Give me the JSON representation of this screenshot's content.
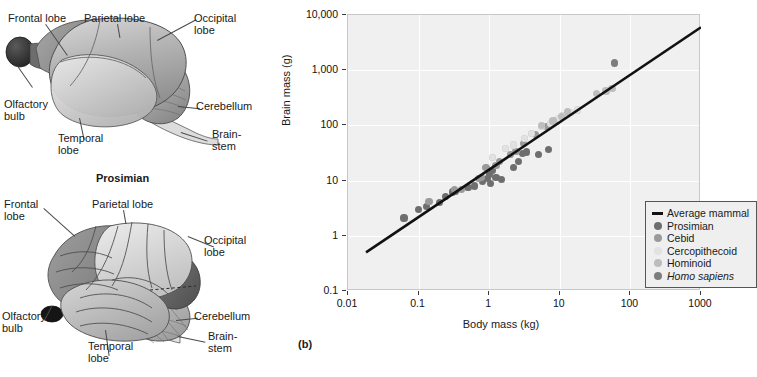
{
  "figure": {
    "panel_tag": "(b)"
  },
  "diagrams": [
    {
      "name": "prosimian-brain",
      "caption": "Prosimian",
      "labels": [
        {
          "key": "frontal",
          "text": "Frontal lobe"
        },
        {
          "key": "parietal",
          "text": "Parietal lobe"
        },
        {
          "key": "occipital",
          "text": "Occipital\nlobe"
        },
        {
          "key": "olfactory",
          "text": "Olfactory\nbulb"
        },
        {
          "key": "temporal",
          "text": "Temporal\nlobe"
        },
        {
          "key": "cerebellum",
          "text": "Cerebellum"
        },
        {
          "key": "brainstem",
          "text": "Brain-\nstem"
        }
      ]
    },
    {
      "name": "anthropoid-brain",
      "caption": "",
      "labels": [
        {
          "key": "frontal",
          "text": "Frontal\nlobe"
        },
        {
          "key": "parietal",
          "text": "Parietal lobe"
        },
        {
          "key": "occipital",
          "text": "Occipital\nlobe"
        },
        {
          "key": "olfactory",
          "text": "Olfactory\nbulb"
        },
        {
          "key": "temporal",
          "text": "Temporal\nlobe"
        },
        {
          "key": "cerebellum",
          "text": "Cerebellum"
        },
        {
          "key": "brainstem",
          "text": "Brain-\nstem"
        }
      ]
    }
  ],
  "chart_data": {
    "type": "scatter",
    "title": "",
    "xlabel": "Body mass (kg)",
    "ylabel": "Brain mass (g)",
    "xscale": "log",
    "yscale": "log",
    "xlim": [
      0.01,
      1000
    ],
    "ylim": [
      0.1,
      10000
    ],
    "xticks": [
      0.01,
      0.1,
      1,
      10,
      100,
      1000
    ],
    "xticklabels": [
      "0.01",
      "0.1",
      "1",
      "10",
      "100",
      "1000"
    ],
    "yticks": [
      0.1,
      1,
      10,
      100,
      1000,
      10000
    ],
    "yticklabels": [
      "0.1",
      "1",
      "10",
      "100",
      "1,000",
      "10,000"
    ],
    "grid": true,
    "legend_position": "lower right",
    "legend_title": "",
    "colors": {
      "average_mammal": "#111111",
      "prosimian": "#6e6e6e",
      "cebid": "#9a9a9a",
      "cercopithecoid": "#e2e2e2",
      "hominoid": "#bdbdbd",
      "homo_sapiens": "#7d7d7d"
    },
    "trendline": {
      "name": "Average mammal",
      "x": [
        0.018,
        1000
      ],
      "y": [
        0.5,
        6000
      ]
    },
    "series": [
      {
        "name": "Prosimian",
        "color": "#6e6e6e",
        "points": [
          [
            0.062,
            2.1
          ],
          [
            0.1,
            3.0
          ],
          [
            0.13,
            3.4
          ],
          [
            0.2,
            4.0
          ],
          [
            0.24,
            5.2
          ],
          [
            0.3,
            6.2
          ],
          [
            0.33,
            6.4
          ],
          [
            0.5,
            7.4
          ],
          [
            0.62,
            8.0
          ],
          [
            0.8,
            9.5
          ],
          [
            0.95,
            11.0
          ],
          [
            1.0,
            13.0
          ],
          [
            1.05,
            9.0
          ],
          [
            1.1,
            15.0
          ],
          [
            1.25,
            11.5
          ],
          [
            1.5,
            10.5
          ],
          [
            2.2,
            17.0
          ],
          [
            2.6,
            22.0
          ],
          [
            3.0,
            31.0
          ],
          [
            3.4,
            33.0
          ],
          [
            5.0,
            30.0
          ],
          [
            7.0,
            36.0
          ]
        ]
      },
      {
        "name": "Cebid",
        "color": "#9a9a9a",
        "points": [
          [
            0.14,
            4.2
          ],
          [
            0.32,
            6.8
          ],
          [
            0.4,
            7.0
          ],
          [
            0.7,
            11.0
          ],
          [
            0.78,
            11.5
          ],
          [
            0.9,
            17.0
          ],
          [
            1.25,
            19.0
          ],
          [
            1.4,
            22.0
          ],
          [
            2.0,
            30.0
          ],
          [
            2.4,
            34.0
          ],
          [
            3.1,
            47.0
          ],
          [
            4.5,
            68.0
          ],
          [
            6.5,
            95.0
          ],
          [
            9.0,
            120.0
          ]
        ]
      },
      {
        "name": "Cercopithecoid",
        "color": "#e2e2e2",
        "points": [
          [
            1.1,
            26.0
          ],
          [
            1.7,
            38.0
          ],
          [
            2.2,
            44.0
          ],
          [
            3.2,
            58.0
          ],
          [
            4.0,
            72.0
          ],
          [
            5.5,
            95.0
          ],
          [
            7.5,
            110.0
          ],
          [
            9.5,
            135.0
          ],
          [
            11.0,
            150.0
          ],
          [
            14.0,
            170.0
          ],
          [
            18.0,
            190.0
          ]
        ]
      },
      {
        "name": "Hominoid",
        "color": "#bdbdbd",
        "points": [
          [
            5.5,
            100.0
          ],
          [
            8.0,
            120.0
          ],
          [
            10.5,
            145.0
          ],
          [
            13.0,
            175.0
          ],
          [
            33.0,
            380.0
          ],
          [
            45.0,
            420.0
          ],
          [
            55.0,
            470.0
          ]
        ]
      },
      {
        "name": "Homo sapiens",
        "color": "#7d7d7d",
        "points": [
          [
            60.0,
            1350.0
          ]
        ]
      }
    ],
    "legend_entries": [
      {
        "label": "Average mammal",
        "marker": "line",
        "color": "#111111",
        "italic": false
      },
      {
        "label": "Prosimian",
        "marker": "dot",
        "color": "#6e6e6e",
        "italic": false
      },
      {
        "label": "Cebid",
        "marker": "dot",
        "color": "#9a9a9a",
        "italic": false
      },
      {
        "label": "Cercopithecoid",
        "marker": "dot",
        "color": "#e2e2e2",
        "italic": false
      },
      {
        "label": "Hominoid",
        "marker": "dot",
        "color": "#bdbdbd",
        "italic": false
      },
      {
        "label": "Homo sapiens",
        "marker": "dot",
        "color": "#7d7d7d",
        "italic": true
      }
    ]
  }
}
